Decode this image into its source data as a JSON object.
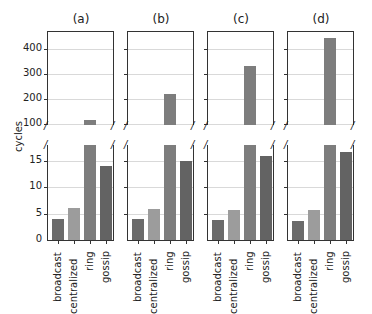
{
  "figure": {
    "ylabel": "cycles",
    "panels": [
      {
        "title": "(a)"
      },
      {
        "title": "(b)"
      },
      {
        "title": "(c)"
      },
      {
        "title": "(d)"
      }
    ],
    "top_yticks": [
      "400",
      "300",
      "200",
      "100"
    ],
    "bottom_yticks": [
      "15",
      "10",
      "5",
      "0"
    ],
    "categories": [
      "broadcast",
      "centralized",
      "ring",
      "gossip"
    ],
    "colors": {
      "broadcast": "#6b6b6b",
      "centralized": "#9c9c9c",
      "ring": "#7d7d7d",
      "gossip": "#636363",
      "grid": "#d9d9d9",
      "axis": "#333333"
    },
    "break_marker": "/"
  },
  "chart_data": {
    "type": "bar",
    "title": "",
    "xlabel": "",
    "ylabel": "cycles",
    "broken_axis": {
      "lower_ylim": [
        0,
        18
      ],
      "upper_ylim": [
        95,
        470
      ]
    },
    "grid": true,
    "legend": null,
    "categories": [
      "broadcast",
      "centralized",
      "ring",
      "gossip"
    ],
    "panels": [
      {
        "title": "(a)",
        "values": [
          4.0,
          6.0,
          115,
          14.0
        ]
      },
      {
        "title": "(b)",
        "values": [
          3.9,
          5.8,
          222,
          15.0
        ]
      },
      {
        "title": "(c)",
        "values": [
          3.8,
          5.7,
          332,
          15.8
        ]
      },
      {
        "title": "(d)",
        "values": [
          3.6,
          5.7,
          443,
          16.6
        ]
      }
    ]
  }
}
